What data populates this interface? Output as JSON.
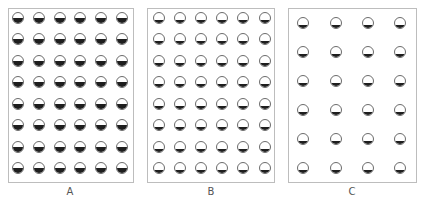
{
  "figure": {
    "panels": [
      {
        "id": "A",
        "label": "A",
        "rows": 8,
        "cols": 6,
        "fill_fraction": 0.5,
        "box": {
          "x": 8,
          "y": 8,
          "w": 126,
          "h": 175
        },
        "col_centers": [
          18,
          39,
          60,
          80,
          101,
          122
        ],
        "row_centers": [
          18,
          39,
          61,
          82,
          104,
          125,
          147,
          168
        ],
        "label_pos": {
          "x": 70,
          "y": 192
        }
      },
      {
        "id": "B",
        "label": "B",
        "rows": 8,
        "cols": 6,
        "fill_fraction": 0.3,
        "box": {
          "x": 147,
          "y": 8,
          "w": 128,
          "h": 175
        },
        "col_centers": [
          159,
          180,
          201,
          222,
          243,
          265
        ],
        "row_centers": [
          18,
          39,
          61,
          82,
          104,
          125,
          147,
          168
        ],
        "label_pos": {
          "x": 211,
          "y": 192
        }
      },
      {
        "id": "C",
        "label": "C",
        "rows": 6,
        "cols": 4,
        "fill_fraction": 0.3,
        "box": {
          "x": 288,
          "y": 8,
          "w": 129,
          "h": 175
        },
        "col_centers": [
          303,
          336,
          368,
          400
        ],
        "row_centers": [
          23,
          52,
          81,
          110,
          139,
          168
        ],
        "label_pos": {
          "x": 352,
          "y": 192
        }
      }
    ],
    "colors": {
      "border": "#bdbdbd",
      "circle_outline": "#6b6b6b",
      "fill": "#1e1e1e",
      "label": "#555555"
    }
  }
}
